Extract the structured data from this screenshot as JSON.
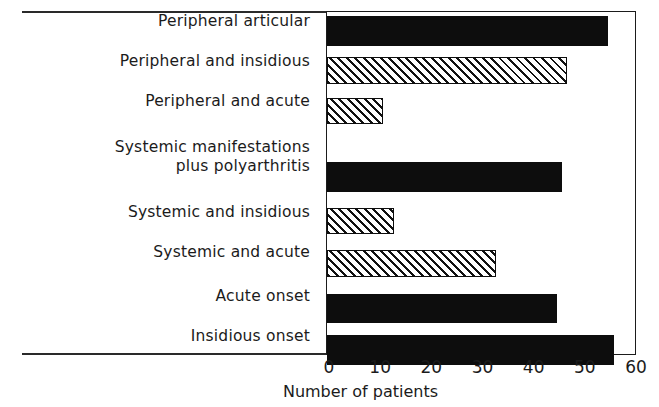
{
  "chart_data": {
    "type": "bar",
    "orientation": "horizontal",
    "title": "",
    "xlabel": "Number of patients",
    "ylabel": "",
    "xlim": [
      0,
      60
    ],
    "xticks": [
      0,
      10,
      20,
      30,
      40,
      50,
      60
    ],
    "grid": false,
    "legend": null,
    "categories": [
      "Peripheral articular",
      "Peripheral and insidious",
      "Peripheral and acute",
      "Systemic manifestations\nplus polyarthritis",
      "Systemic and insidious",
      "Systemic and acute",
      "Acute onset",
      "Insidious onset"
    ],
    "values": [
      55,
      47,
      11,
      46,
      13,
      33,
      45,
      56
    ],
    "fills": [
      "solid",
      "hatch",
      "hatch",
      "solid",
      "hatch",
      "hatch",
      "solid",
      "solid"
    ],
    "colors": {
      "solid": "#0d0d0d",
      "hatch_line": "#111111",
      "hatch_background": "#ffffff",
      "axis": "#1b1b1b",
      "background": "#ffffff"
    }
  },
  "axis": {
    "tick_labels": [
      "0",
      "10",
      "20",
      "30",
      "40",
      "50",
      "60"
    ],
    "x_axis_title": "Number of patients"
  }
}
